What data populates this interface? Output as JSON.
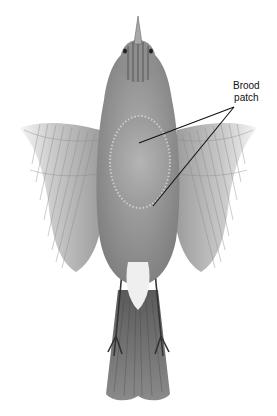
{
  "figure": {
    "annotation": {
      "line1": "Brood",
      "line2": "patch",
      "pointer_targets": [
        "upper breast",
        "lower belly patch"
      ]
    },
    "colors": {
      "background": "#ffffff",
      "plumage_light": "#c8c8c8",
      "plumage_mid": "#9a9a9a",
      "plumage_dark": "#5a5a5a",
      "patch": "#a9a9a9",
      "leader_line": "#111111"
    }
  }
}
